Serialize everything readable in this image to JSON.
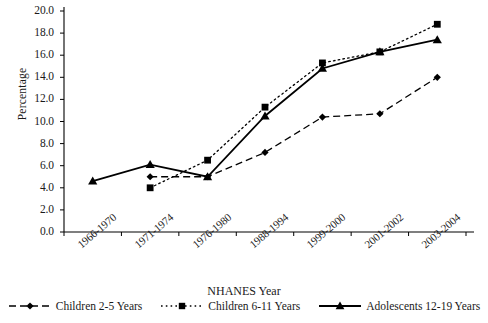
{
  "chart_data": {
    "type": "line",
    "title": "",
    "xlabel": "NHANES Year",
    "ylabel": "Percentage",
    "categories": [
      "1966-1970",
      "1971-1974",
      "1976-1980",
      "1988-1994",
      "1999-2000",
      "2001-2002",
      "2003-2004"
    ],
    "ylim": [
      0.0,
      20.0
    ],
    "ytick_labels": [
      "0.0",
      "2.0",
      "4.0",
      "6.0",
      "8.0",
      "10.0",
      "12.0",
      "14.0",
      "16.0",
      "18.0",
      "20.0"
    ],
    "ytick_values": [
      0.0,
      2.0,
      4.0,
      6.0,
      8.0,
      10.0,
      12.0,
      14.0,
      16.0,
      18.0,
      20.0
    ],
    "grid": false,
    "legend_position": "bottom",
    "series": [
      {
        "name": "Children 2-5 Years",
        "marker": "diamond",
        "line_style": "dashed",
        "color": "#000000",
        "x": [
          "1971-1974",
          "1976-1980",
          "1988-1994",
          "1999-2000",
          "2001-2002",
          "2003-2004"
        ],
        "values": [
          5.0,
          5.0,
          7.2,
          10.4,
          10.7,
          14.0
        ]
      },
      {
        "name": "Children 6-11 Years",
        "marker": "square",
        "line_style": "dotted",
        "color": "#000000",
        "x": [
          "1971-1974",
          "1976-1980",
          "1988-1994",
          "1999-2000",
          "2001-2002",
          "2003-2004"
        ],
        "values": [
          4.0,
          6.5,
          11.3,
          15.3,
          16.3,
          18.8
        ]
      },
      {
        "name": "Adolescents 12-19 Years",
        "marker": "triangle",
        "line_style": "solid",
        "color": "#000000",
        "x": [
          "1966-1970",
          "1971-1974",
          "1976-1980",
          "1988-1994",
          "1999-2000",
          "2001-2002",
          "2003-2004"
        ],
        "values": [
          4.6,
          6.1,
          5.0,
          10.5,
          14.8,
          16.3,
          17.4
        ]
      }
    ]
  },
  "axis": {
    "ylabel": "Percentage",
    "xlabel": "NHANES Year"
  },
  "legend": {
    "items": [
      {
        "label": "Children 2-5 Years",
        "marker": "diamond",
        "style": "dashed"
      },
      {
        "label": "Children 6-11 Years",
        "marker": "square",
        "style": "dotted"
      },
      {
        "label": "Adolescents 12-19 Years",
        "marker": "triangle",
        "style": "solid"
      }
    ]
  }
}
